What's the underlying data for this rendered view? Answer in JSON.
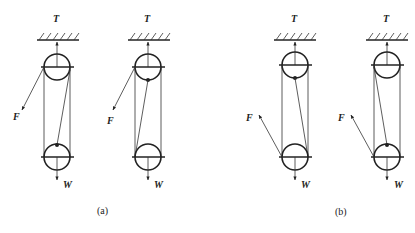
{
  "cropped_header_text": "",
  "labels": {
    "tension": "T",
    "force": "F",
    "weight": "W"
  },
  "captions": {
    "a": "(a)",
    "b": "(b)"
  },
  "figures": [
    {
      "id": "a1",
      "group": "a",
      "center_x": 57,
      "F_direction": "down-left from top pulley",
      "rope": "right side of top pulley to top of lower pulley"
    },
    {
      "id": "a2",
      "group": "a",
      "center_x": 148,
      "F_direction": "down-left from top pulley",
      "rope": "bottom of top pulley to left side of lower pulley"
    },
    {
      "id": "b1",
      "group": "b",
      "center_x": 295,
      "F_direction": "up-left from lower pulley",
      "rope": "bottom of top pulley to right side of lower pulley"
    },
    {
      "id": "b2",
      "group": "b",
      "center_x": 387,
      "F_direction": "up-left from lower pulley",
      "rope": "left side of top pulley to top of lower pulley"
    }
  ]
}
